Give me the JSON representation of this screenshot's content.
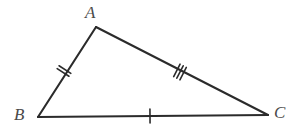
{
  "figure": {
    "type": "geometry-diagram",
    "shape": "triangle",
    "background_color": "#ffffff",
    "stroke_color": "#2b2b2b",
    "label_color": "#4a4a4a",
    "stroke_width": 2.1,
    "tick_stroke_width": 1.6,
    "vertices": [
      {
        "name": "A",
        "label": "A",
        "x": 96,
        "y": 27,
        "label_x": 85,
        "label_y": 4
      },
      {
        "name": "B",
        "label": "B",
        "x": 38,
        "y": 117,
        "label_x": 14,
        "label_y": 106
      },
      {
        "name": "C",
        "label": "C",
        "x": 268,
        "y": 115,
        "label_x": 274,
        "label_y": 104
      }
    ],
    "sides": [
      {
        "name": "AB",
        "from": "A",
        "to": "B",
        "tick_count": 2,
        "tick_center_x": 64,
        "tick_center_y": 71
      },
      {
        "name": "AC",
        "from": "A",
        "to": "C",
        "tick_count": 3,
        "tick_center_x": 180,
        "tick_center_y": 72
      },
      {
        "name": "BC",
        "from": "B",
        "to": "C",
        "tick_count": 1,
        "tick_center_x": 150,
        "tick_center_y": 116
      }
    ],
    "tick_half_length": 7,
    "tick_spacing": 3.5
  }
}
